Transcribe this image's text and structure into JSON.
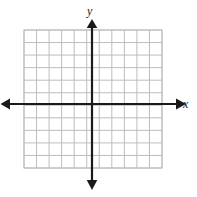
{
  "figure": {
    "kind": "coordinate-grid",
    "title": "",
    "background_color": "#ffffff",
    "width": 197,
    "height": 197
  },
  "chart_data": {
    "type": "scatter",
    "title": "",
    "subtitle": "",
    "xlabel": "x",
    "ylabel": "y",
    "series": [
      {
        "name": "",
        "x": [],
        "y": []
      }
    ],
    "x": [],
    "categories": [],
    "values": [],
    "xlim": [
      -5,
      6
    ],
    "ylim": [
      -5,
      6
    ],
    "xticks": [],
    "yticks": [],
    "xticklabels": [],
    "yticklabels": [],
    "grid": true,
    "grid_columns": 11,
    "grid_rows": 11,
    "legend": false,
    "legend_position": "none",
    "annotations": [],
    "axis_arrows": "both-ends-both-axes",
    "origin_x_units_from_left": 5,
    "origin_y_units_from_top": 6
  },
  "axes": {
    "x_axis": {
      "label": "x",
      "color": "#1a1a1a",
      "arrow_left": "◀",
      "arrow_right": "▶"
    },
    "y_axis": {
      "label": "y",
      "color": "#1a1a1a",
      "arrow_up": "▲",
      "arrow_down": "▼"
    }
  },
  "grid": {
    "line_color": "#bdbdbd",
    "border_color": "#bdbdbd",
    "cell_size_px": 12.55,
    "left_px": 24,
    "top_px": 30,
    "right_px": 162,
    "bottom_px": 168,
    "columns": 11,
    "rows": 11
  }
}
